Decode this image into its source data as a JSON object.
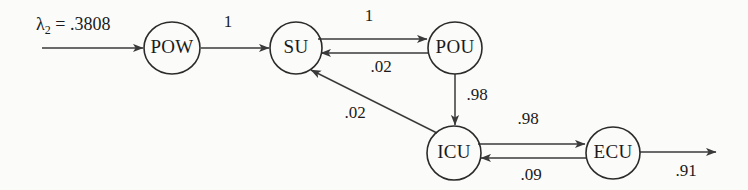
{
  "diagram": {
    "background_color": "#fbfbf9",
    "stroke_color": "#2b2b2b",
    "text_color": "#1a1a1a",
    "source_annotation": {
      "symbol": "λ",
      "subscript": "2",
      "equals": " = ",
      "value": ".3808",
      "full_text": "λ2 = .3808"
    },
    "nodes": [
      {
        "id": "POW",
        "label": "POW",
        "cx": 172,
        "cy": 48,
        "rx": 28,
        "ry": 26
      },
      {
        "id": "SU",
        "label": "SU",
        "cx": 296,
        "cy": 48,
        "rx": 26,
        "ry": 26
      },
      {
        "id": "POU",
        "label": "POU",
        "cx": 455,
        "cy": 48,
        "rx": 27,
        "ry": 26
      },
      {
        "id": "ICU",
        "label": "ICU",
        "cx": 454,
        "cy": 153,
        "rx": 27,
        "ry": 27
      },
      {
        "id": "ECU",
        "label": "ECU",
        "cx": 613,
        "cy": 153,
        "rx": 27,
        "ry": 26
      }
    ],
    "edges": [
      {
        "id": "entry-to-pow",
        "from": "entry",
        "to": "POW",
        "label": "",
        "kind": "external-in"
      },
      {
        "id": "pow-to-su",
        "from": "POW",
        "to": "SU",
        "label": "1",
        "kind": "horizontal"
      },
      {
        "id": "su-to-pou",
        "from": "SU",
        "to": "POU",
        "label": "1",
        "kind": "horizontal"
      },
      {
        "id": "pou-to-su",
        "from": "POU",
        "to": "SU",
        "label": ".02",
        "kind": "horizontal-return"
      },
      {
        "id": "pou-to-icu",
        "from": "POU",
        "to": "ICU",
        "label": ".98",
        "kind": "vertical"
      },
      {
        "id": "icu-to-su",
        "from": "ICU",
        "to": "SU",
        "label": ".02",
        "kind": "diagonal"
      },
      {
        "id": "icu-to-ecu",
        "from": "ICU",
        "to": "ECU",
        "label": ".98",
        "kind": "horizontal"
      },
      {
        "id": "ecu-to-icu",
        "from": "ECU",
        "to": "ICU",
        "label": ".09",
        "kind": "horizontal-return"
      },
      {
        "id": "ecu-to-exit",
        "from": "ECU",
        "to": "exit",
        "label": ".91",
        "kind": "external-out"
      }
    ],
    "edge_labels": {
      "pow_to_su": "1",
      "su_to_pou": "1",
      "pou_to_su": ".02",
      "pou_to_icu": ".98",
      "icu_to_su": ".02",
      "icu_to_ecu": ".98",
      "ecu_to_icu": ".09",
      "ecu_exit": ".91"
    }
  }
}
